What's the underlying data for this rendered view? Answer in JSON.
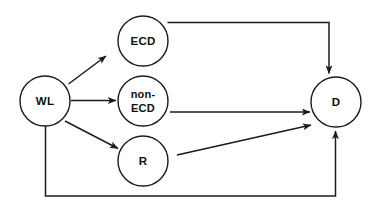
{
  "diagram": {
    "type": "flow-diagram",
    "background_color": "#ffffff",
    "line_color": "#1b1b1b",
    "text_color": "#101010",
    "nodes": [
      {
        "id": "WL",
        "label": "WL",
        "label_lines": [
          "WL"
        ],
        "cx": 45,
        "cy": 101,
        "r": 25
      },
      {
        "id": "ECD",
        "label": "ECD",
        "label_lines": [
          "ECD"
        ],
        "cx": 143,
        "cy": 41,
        "r": 25
      },
      {
        "id": "non-ECD",
        "label": "non-ECD",
        "label_lines": [
          "non-",
          "ECD"
        ],
        "cx": 143,
        "cy": 101,
        "r": 25
      },
      {
        "id": "R",
        "label": "R",
        "label_lines": [
          "R"
        ],
        "cx": 143,
        "cy": 161,
        "r": 25
      },
      {
        "id": "D",
        "label": "D",
        "label_lines": [
          "D"
        ],
        "cx": 336,
        "cy": 102,
        "r": 25
      }
    ],
    "edges": [
      {
        "id": "wl-ecd",
        "from": "WL",
        "to": "ECD",
        "style": "straight-diagonal",
        "arrow": "end"
      },
      {
        "id": "wl-nonecd",
        "from": "WL",
        "to": "non-ECD",
        "style": "straight-horizontal",
        "arrow": "end"
      },
      {
        "id": "wl-r",
        "from": "WL",
        "to": "R",
        "style": "straight-diagonal",
        "arrow": "end"
      },
      {
        "id": "ecd-d",
        "from": "ECD",
        "to": "D",
        "style": "elbow-right-down",
        "arrow": "end"
      },
      {
        "id": "nonecd-d",
        "from": "non-ECD",
        "to": "D",
        "style": "straight-horizontal",
        "arrow": "end"
      },
      {
        "id": "r-d",
        "from": "R",
        "to": "D",
        "style": "straight-diagonal",
        "arrow": "end"
      },
      {
        "id": "wl-d-bottom",
        "from": "WL",
        "to": "D",
        "style": "elbow-down-right-up",
        "arrow": "end"
      }
    ]
  }
}
